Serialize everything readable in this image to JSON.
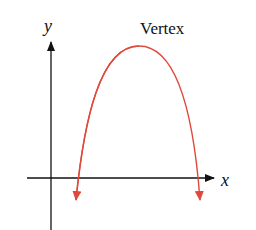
{
  "diagram": {
    "type": "parabola-graph",
    "labels": {
      "y_axis": "y",
      "x_axis": "x",
      "vertex": "Vertex"
    },
    "colors": {
      "axes": "#111111",
      "curve": "#e0483c"
    },
    "curve": {
      "opens": "down",
      "vertex_px": [
        139,
        46
      ],
      "x_intercepts_px": [
        78,
        197
      ]
    }
  }
}
